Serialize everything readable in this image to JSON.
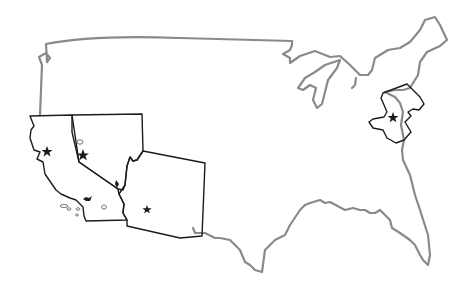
{
  "map": {
    "title": "",
    "style": "hand-drawn outline map of the contiguous United States",
    "colors": {
      "background": "#ffffff",
      "country_outline": "#8a8a8a",
      "state_outline": "#1c1c1c",
      "marker": "#1c1c1c"
    },
    "highlighted_states": [
      {
        "name": "California",
        "marker": "star",
        "marker_label": "capital"
      },
      {
        "name": "Nevada",
        "marker": "star",
        "marker_label": "capital"
      },
      {
        "name": "Arizona",
        "marker": "star",
        "marker_label": "capital"
      },
      {
        "name": "New Jersey",
        "marker": "star",
        "marker_label": "capital"
      }
    ],
    "other_features": [
      {
        "name": "Lake Michigan",
        "type": "lake"
      },
      {
        "name": "Lake Tahoe",
        "type": "lake"
      },
      {
        "name": "Salton Sea",
        "type": "lake"
      },
      {
        "name": "Channel Islands",
        "type": "islands"
      }
    ]
  }
}
